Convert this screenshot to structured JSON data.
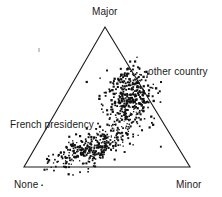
{
  "figure": {
    "kind": "ternary-scatter-diagram",
    "background_color": "#ffffff",
    "line_color": "#1a1a1a",
    "point_color": "#111111"
  },
  "axis_labels": {
    "top": "Major",
    "bottom_left": "None",
    "bottom_right": "Minor"
  },
  "annotations": {
    "cluster_upper_right": "other country",
    "cluster_lower_left": "French presidency"
  },
  "chart_data": {
    "type": "scatter",
    "title": "",
    "xlabel": "",
    "ylabel": "",
    "grid": false,
    "legend_position": "inline-annotation",
    "triangle": {
      "apex": [
        105,
        27
      ],
      "bottom_left": [
        24,
        167
      ],
      "bottom_right": [
        190,
        167
      ],
      "corner_labels": [
        "Major",
        "None",
        "Minor"
      ]
    },
    "series": [
      {
        "name": "other country",
        "marker": "square",
        "marker_size": 1.6,
        "n_points": 360,
        "center": [
          130,
          96
        ],
        "spread": [
          12,
          15
        ],
        "label_anchor": [
          148,
          71
        ]
      },
      {
        "name": "French presidency",
        "marker": "square",
        "marker_size": 1.5,
        "n_points": 330,
        "center": [
          88,
          150
        ],
        "spread": [
          20,
          7
        ],
        "rotation_deg": -18,
        "label_anchor": [
          10,
          124
        ]
      },
      {
        "name": "bridge",
        "marker": "square",
        "marker_size": 1.4,
        "n_points": 70,
        "from": [
          100,
          145
        ],
        "to": [
          132,
          112
        ]
      }
    ]
  }
}
